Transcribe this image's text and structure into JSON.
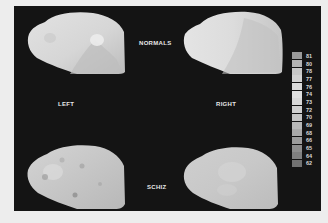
{
  "figure": {
    "group_labels": {
      "top": "NORMALS",
      "bottom": "SCHIZ"
    },
    "hemisphere_labels": {
      "left": "LEFT",
      "right": "RIGHT"
    },
    "panels": [
      {
        "id": "normals-left",
        "group": "NORMALS",
        "hemisphere": "LEFT"
      },
      {
        "id": "normals-right",
        "group": "NORMALS",
        "hemisphere": "RIGHT"
      },
      {
        "id": "schiz-left",
        "group": "SCHIZ",
        "hemisphere": "LEFT"
      },
      {
        "id": "schiz-right",
        "group": "SCHIZ",
        "hemisphere": "RIGHT"
      }
    ],
    "legend": {
      "values": [
        "81",
        "80",
        "78",
        "77",
        "76",
        "74",
        "73",
        "72",
        "70",
        "69",
        "68",
        "66",
        "65",
        "64",
        "62"
      ],
      "colors": [
        "#9a9a9a",
        "#b4b4b4",
        "#c8c8c8",
        "#d2d2d2",
        "#dadada",
        "#e0e0e0",
        "#d8d8d8",
        "#cfcfcf",
        "#c4c4c4",
        "#b8b8b8",
        "#aaaaaa",
        "#9c9c9c",
        "#8e8e8e",
        "#808080",
        "#727272"
      ]
    },
    "colors": {
      "background": "#141414",
      "page": "#ededed",
      "brain_light": "#dedede",
      "brain_mid": "#c4c4c4",
      "brain_dark": "#a8a8a8"
    }
  }
}
